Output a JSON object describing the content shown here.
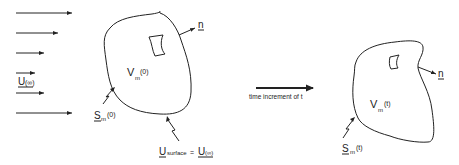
{
  "diagram": {
    "left_state": {
      "freestream_label": "U",
      "freestream_sub": "(∞)",
      "volume_label": "V",
      "volume_sub": "m",
      "volume_sup": "(0)",
      "surface_label": "S",
      "surface_sub": "m",
      "surface_sup": "(0)",
      "normal_label": "n",
      "surface_velocity_label": "U",
      "surface_velocity_sub": "surface",
      "surface_velocity_eq": "=",
      "surface_velocity_rhs": "U",
      "surface_velocity_rhs_sub": "(∞)"
    },
    "transition": {
      "label": "time increment of t"
    },
    "right_state": {
      "volume_label": "V",
      "volume_sub": "m",
      "volume_sup": "(t)",
      "surface_label": "S",
      "surface_sub": "m",
      "surface_sup": "(t)",
      "normal_label": "n"
    },
    "colors": {
      "line": "#222222",
      "background": "#ffffff"
    }
  }
}
